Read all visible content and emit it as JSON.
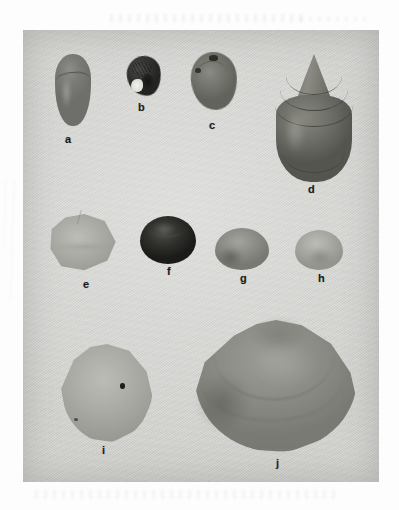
{
  "figure": {
    "kind": "photographic-plate",
    "plate_background_color": "#d6d6d3",
    "page_background_color": "#fdfdfd",
    "label_color": "#1d1d1d",
    "specimen_count": 10
  },
  "specimens": [
    {
      "id": "a",
      "label": "a",
      "row": 1,
      "shape": "elongate ovate gastropod",
      "tone": "medium grey",
      "relative_size": "small"
    },
    {
      "id": "b",
      "label": "b",
      "row": 1,
      "shape": "small gastropod with bright white aperture",
      "tone": "very dark",
      "relative_size": "smallest"
    },
    {
      "id": "c",
      "label": "c",
      "row": 1,
      "shape": "globose gastropod with dark apical marks",
      "tone": "medium-dark grey",
      "relative_size": "small"
    },
    {
      "id": "d",
      "label": "d",
      "row": 1,
      "shape": "large conical turbinate gastropod with high stepped spire",
      "tone": "dark grey",
      "relative_size": "large"
    },
    {
      "id": "e",
      "label": "e",
      "row": 2,
      "shape": "angular pale shell with straight dorsal edge",
      "tone": "light grey",
      "relative_size": "medium"
    },
    {
      "id": "f",
      "label": "f",
      "row": 2,
      "shape": "rounded dome-shaped shell",
      "tone": "near black",
      "relative_size": "medium-small"
    },
    {
      "id": "g",
      "label": "g",
      "row": 2,
      "shape": "rounded shell",
      "tone": "medium grey",
      "relative_size": "small"
    },
    {
      "id": "h",
      "label": "h",
      "row": 2,
      "shape": "rounded shell",
      "tone": "light grey",
      "relative_size": "small"
    },
    {
      "id": "i",
      "label": "i",
      "row": 3,
      "shape": "rounded-triangular bivalve valve with small dark speck",
      "tone": "light grey",
      "relative_size": "large"
    },
    {
      "id": "j",
      "label": "j",
      "row": 3,
      "shape": "broad trigonal bivalve valve with pointed umbo and concentric growth line",
      "tone": "medium grey",
      "relative_size": "largest"
    }
  ]
}
